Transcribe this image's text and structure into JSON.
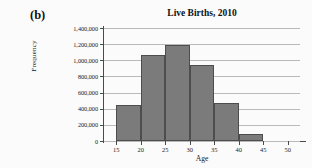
{
  "panel": {
    "label": "(b)"
  },
  "chart_data": {
    "type": "bar",
    "title": "Live Births, 2010",
    "xlabel": "Age",
    "ylabel": "Frequency",
    "xlim": [
      12.5,
      52.5
    ],
    "ylim": [
      0,
      1400000
    ],
    "grid": true,
    "legend": "none",
    "bin_width": 5,
    "categories": [
      "15-20",
      "20-25",
      "25-30",
      "30-35",
      "35-40",
      "40-45"
    ],
    "bin_starts": [
      15,
      20,
      25,
      30,
      35,
      40
    ],
    "bin_ends": [
      20,
      25,
      30,
      35,
      40,
      45
    ],
    "values": [
      440000,
      1070000,
      1190000,
      940000,
      470000,
      85000
    ],
    "xticks": [
      15,
      20,
      25,
      30,
      35,
      40,
      45,
      50
    ],
    "xtick_labels": [
      "15",
      "20",
      "25",
      "30",
      "35",
      "40",
      "45",
      "50"
    ],
    "yticks": [
      0,
      200000,
      400000,
      600000,
      800000,
      1000000,
      1200000,
      1400000
    ],
    "ytick_labels": [
      "0",
      "200,000",
      "400,000",
      "600,000",
      "800,000",
      "1,000,000",
      "1,200,000",
      "1,400,000"
    ],
    "bar_color": "#7b7b7b",
    "bar_edge_color": "#4d4d4d",
    "grid_color": "#b9b9b9",
    "axis_color": "#4a4a4a"
  }
}
